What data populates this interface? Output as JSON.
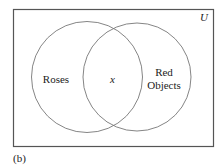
{
  "diagram": {
    "type": "venn",
    "universe_label": "U",
    "caption": "(b)",
    "sets": [
      {
        "name": "Roses",
        "label_lines": [
          "Roses"
        ]
      },
      {
        "name": "Red Objects",
        "label_lines": [
          "Red",
          "Objects"
        ]
      }
    ],
    "intersection_label": "x",
    "colors": {
      "stroke": "#555555",
      "text": "#222222",
      "background": "#ffffff"
    }
  }
}
